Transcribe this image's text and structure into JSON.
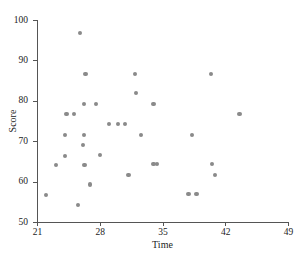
{
  "chart_data": {
    "type": "scatter",
    "title": "",
    "xlabel": "Time",
    "ylabel": "Score",
    "xlim": [
      21,
      49
    ],
    "ylim": [
      50,
      100
    ],
    "xticks": [
      21,
      28,
      35,
      42,
      49
    ],
    "yticks": [
      50,
      60,
      70,
      80,
      90,
      100
    ],
    "grid": false,
    "legend": null,
    "marker_color": "#8a8a8a",
    "axis_color": "#555555",
    "points": [
      {
        "x": 22.0,
        "y": 56.7
      },
      {
        "x": 23.1,
        "y": 64.2
      },
      {
        "x": 24.1,
        "y": 71.5
      },
      {
        "x": 24.1,
        "y": 66.4
      },
      {
        "x": 24.3,
        "y": 76.8
      },
      {
        "x": 25.1,
        "y": 76.8
      },
      {
        "x": 25.6,
        "y": 54.2
      },
      {
        "x": 25.8,
        "y": 96.8
      },
      {
        "x": 26.2,
        "y": 71.5
      },
      {
        "x": 26.1,
        "y": 69.1
      },
      {
        "x": 26.2,
        "y": 79.2
      },
      {
        "x": 26.4,
        "y": 86.7
      },
      {
        "x": 26.3,
        "y": 64.2
      },
      {
        "x": 26.9,
        "y": 59.3
      },
      {
        "x": 27.6,
        "y": 79.3
      },
      {
        "x": 28.0,
        "y": 66.6
      },
      {
        "x": 29.0,
        "y": 74.2
      },
      {
        "x": 30.0,
        "y": 74.2
      },
      {
        "x": 30.8,
        "y": 74.2
      },
      {
        "x": 31.2,
        "y": 61.6
      },
      {
        "x": 32.0,
        "y": 81.9
      },
      {
        "x": 31.9,
        "y": 86.7
      },
      {
        "x": 32.6,
        "y": 71.5
      },
      {
        "x": 34.0,
        "y": 79.3
      },
      {
        "x": 34.0,
        "y": 64.3
      },
      {
        "x": 34.4,
        "y": 64.3
      },
      {
        "x": 37.9,
        "y": 56.9
      },
      {
        "x": 38.8,
        "y": 56.9
      },
      {
        "x": 38.3,
        "y": 71.5
      },
      {
        "x": 40.4,
        "y": 86.7
      },
      {
        "x": 40.5,
        "y": 64.3
      },
      {
        "x": 40.9,
        "y": 61.7
      },
      {
        "x": 43.6,
        "y": 76.8
      }
    ]
  }
}
